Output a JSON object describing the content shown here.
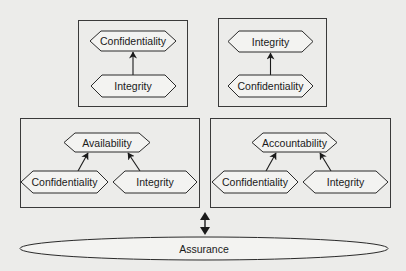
{
  "diagram": {
    "panels": [
      {
        "id": "top-left",
        "nodes": {
          "top": "Confidentiality",
          "bottom": "Integrity"
        },
        "relation": "Integrity -> Confidentiality"
      },
      {
        "id": "top-right",
        "nodes": {
          "top": "Integrity",
          "bottom": "Confidentiality"
        },
        "relation": "Confidentiality -> Integrity"
      },
      {
        "id": "bottom-left",
        "nodes": {
          "top": "Availability",
          "left": "Confidentiality",
          "right": "Integrity"
        },
        "relation": "Confidentiality -> Availability, Integrity -> Availability"
      },
      {
        "id": "bottom-right",
        "nodes": {
          "top": "Accountability",
          "left": "Confidentiality",
          "right": "Integrity"
        },
        "relation": "Confidentiality -> Accountability, Integrity -> Accountability"
      }
    ],
    "base": {
      "label": "Assurance"
    },
    "connector": "bidirectional-arrow"
  },
  "colors": {
    "background": "#ececea",
    "stroke": "#2a2a2a",
    "node_fill": "#f3f3f1",
    "text": "#1a1a1a"
  }
}
